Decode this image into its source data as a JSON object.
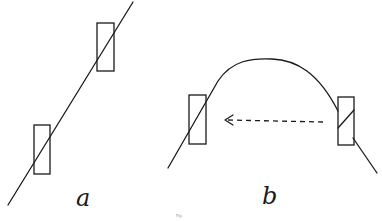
{
  "figure": {
    "panels": [
      {
        "id": "a",
        "label": "a",
        "description": "Straight inclined line passing diagonally through two rectangles"
      },
      {
        "id": "b",
        "label": "b",
        "description": "Arched curve passing through two rectangles with a dashed arrow pointing from right rectangle toward left rectangle"
      }
    ],
    "caption_fragment": "Fig."
  },
  "colors": {
    "ink": "#1a1a1a",
    "background": "#ffffff"
  }
}
